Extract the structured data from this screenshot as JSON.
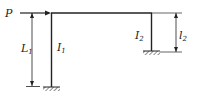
{
  "diagram": {
    "type": "structural-frame",
    "load": {
      "label": "P",
      "direction": "right"
    },
    "columns": [
      {
        "id": "left",
        "inertia_label": "I",
        "inertia_sub": "1",
        "length_label": "L",
        "length_sub": "1",
        "support": "fixed"
      },
      {
        "id": "right",
        "inertia_label": "I",
        "inertia_sub": "2",
        "length_label": "l",
        "length_sub": "2",
        "support": "fixed"
      }
    ]
  },
  "colors": {
    "stroke": "#222222",
    "background": "#ffffff"
  }
}
